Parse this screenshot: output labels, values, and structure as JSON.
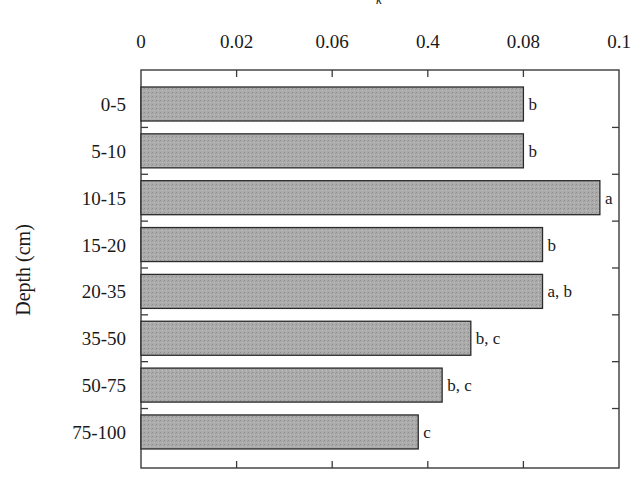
{
  "chart_data": {
    "type": "bar",
    "orientation": "horizontal",
    "title": "",
    "top_axis_partial_title": "k",
    "xlabel": "",
    "ylabel": "Depth (cm)",
    "x_tick_labels": [
      "0",
      "0.02",
      "0.06",
      "0.4",
      "0.08",
      "0.1"
    ],
    "x_tick_positions_value": [
      0,
      0.02,
      0.04,
      0.06,
      0.08,
      0.1
    ],
    "xlim": [
      0,
      0.1
    ],
    "x_axis_position": "top",
    "grid": false,
    "legend": null,
    "categories": [
      "0-5",
      "5-10",
      "10-15",
      "15-20",
      "20-35",
      "35-50",
      "50-75",
      "75-100"
    ],
    "values": [
      0.08,
      0.08,
      0.096,
      0.084,
      0.084,
      0.069,
      0.063,
      0.058
    ],
    "significance_letters": [
      "b",
      "b",
      "a",
      "b",
      "a, b",
      "b, c",
      "b, c",
      "c"
    ],
    "bar_color": "#a9a9a9",
    "bar_edge_color": "#2a2a2a"
  }
}
